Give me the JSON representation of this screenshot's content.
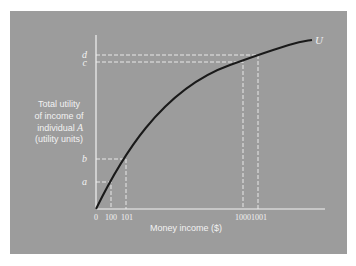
{
  "diagram": {
    "type": "utility-curve",
    "curve_label": "U",
    "y_axis_label_lines": [
      "Total utility",
      "of income of",
      "individual",
      "(utility units)"
    ],
    "y_axis_label_italic": "A",
    "x_axis_label": "Money income ($)",
    "y_ticks": [
      "d",
      "c",
      "b",
      "a"
    ],
    "x_ticks": [
      "0",
      "100",
      "101",
      "1000",
      "1001"
    ],
    "colors": {
      "panel": "#9c9c9c",
      "axes": "#f2f2f2",
      "curve": "#1a1a1a",
      "guides": "#f2f2f2"
    }
  }
}
